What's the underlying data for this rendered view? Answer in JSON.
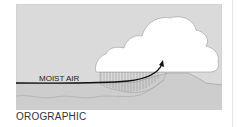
{
  "diagram": {
    "title": "OROGRAPHIC",
    "labels": {
      "airflow": "MOIST AIR"
    },
    "colors": {
      "sky": "#dadada",
      "ground": "#cccccc",
      "cloud": "#ffffff",
      "outline": "#8a8a8a",
      "arrow": "#111111",
      "hatch": "#888888"
    },
    "elements": [
      "sky background",
      "mountain/ground profile",
      "cumulus cloud",
      "moist air arrow rising over slope",
      "hatched rising-air region"
    ]
  }
}
